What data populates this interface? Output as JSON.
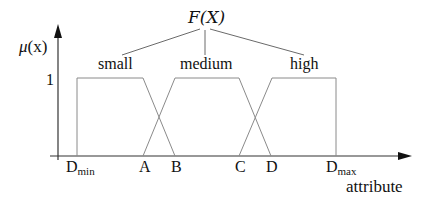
{
  "diagram": {
    "title": "F(X)",
    "y_axis": {
      "label_symbol": "μ",
      "label_arg": "(x)",
      "tick_1": "1"
    },
    "x_axis": {
      "label": "attribute"
    },
    "fuzzy_sets": [
      {
        "name": "small"
      },
      {
        "name": "medium"
      },
      {
        "name": "high"
      }
    ],
    "x_ticks": {
      "dmin_main": "D",
      "dmin_sub": "min",
      "a": "A",
      "b": "B",
      "c": "C",
      "d": "D",
      "dmax_main": "D",
      "dmax_sub": "max"
    },
    "colors": {
      "line": "#7a7a7a",
      "axis": "#333333",
      "text": "#111111"
    }
  }
}
